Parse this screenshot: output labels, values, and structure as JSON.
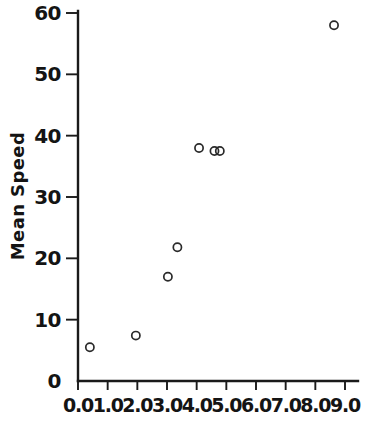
{
  "chart_data": {
    "type": "scatter",
    "title": "",
    "xlabel": "",
    "ylabel": "Mean Speed",
    "xlim": [
      0.0,
      9.0
    ],
    "ylim": [
      0,
      60
    ],
    "grid": false,
    "legend": null,
    "marker_style": "open-circle",
    "x_ticks": [
      0.0,
      1.0,
      2.0,
      3.0,
      4.0,
      5.0,
      6.0,
      7.0,
      8.0,
      9.0
    ],
    "x_ticklabels": [
      "0.0",
      "1.0",
      "2.0",
      "3.0",
      "4.0",
      "5.0",
      "6.0",
      "7.0",
      "8.0",
      "9.0"
    ],
    "y_ticks": [
      0,
      10,
      20,
      30,
      40,
      50,
      60
    ],
    "y_ticklabels": [
      "0",
      "10",
      "20",
      "30",
      "40",
      "50",
      "60"
    ],
    "points": [
      {
        "x": 0.4,
        "y": 5.5
      },
      {
        "x": 1.95,
        "y": 7.4
      },
      {
        "x": 3.03,
        "y": 17.0
      },
      {
        "x": 3.35,
        "y": 21.8
      },
      {
        "x": 4.08,
        "y": 38.0
      },
      {
        "x": 4.6,
        "y": 37.5
      },
      {
        "x": 4.78,
        "y": 37.5
      },
      {
        "x": 8.63,
        "y": 58.0
      }
    ]
  },
  "colors": {
    "ink": "#141414",
    "marker_stroke": "#2a2a2a",
    "background": "#ffffff"
  }
}
